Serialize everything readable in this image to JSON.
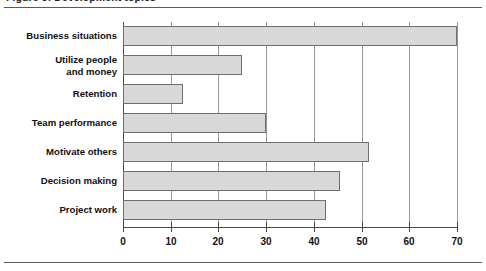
{
  "caption": "Figure 3: Development topics",
  "chart_data": {
    "type": "bar",
    "orientation": "horizontal",
    "title": "",
    "subtitle": "",
    "xlabel": "",
    "ylabel": "",
    "xlim": [
      0,
      70
    ],
    "ylim": null,
    "grid": "vertical gridlines at every major x tick",
    "legend": null,
    "legend_position": "none",
    "xticks": [
      0,
      10,
      20,
      30,
      40,
      50,
      60,
      70
    ],
    "xticklabels": [
      "0",
      "10",
      "20",
      "30",
      "40",
      "50",
      "60",
      "70"
    ],
    "categories": [
      "Business situations",
      "Utilize people\nand money",
      "Retention",
      "Team performance",
      "Motivate others",
      "Decision making",
      "Project work"
    ],
    "values": [
      70,
      25,
      12.5,
      30,
      51.5,
      45.5,
      42.5
    ],
    "bar_color": "#d8d8d8",
    "bar_edge_color": "#6e6e6e",
    "axis_color": "#4a4a4a",
    "grid_color": "#9a9a9a",
    "text_color": "#111111"
  }
}
